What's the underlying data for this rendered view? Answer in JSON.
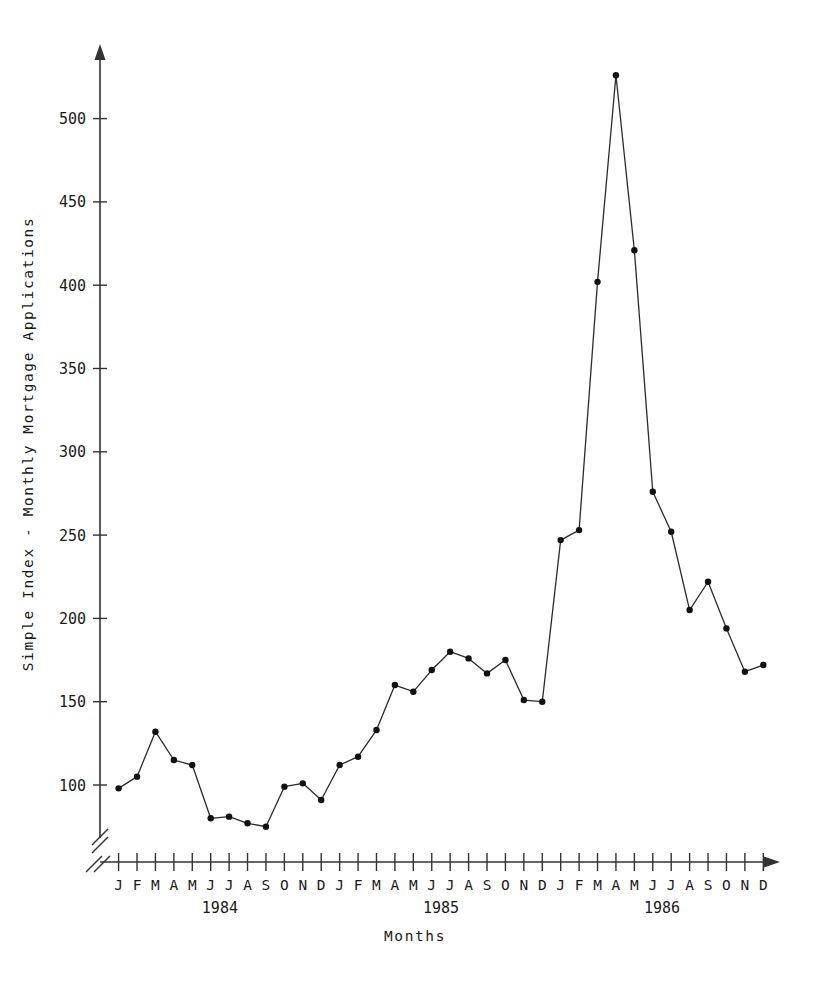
{
  "chart_data": {
    "type": "line",
    "title": "",
    "xlabel": "Months",
    "ylabel": "Simple Index - Monthly Mortgage Applications",
    "grid": false,
    "legend": "none",
    "ylim": [
      60,
      545
    ],
    "y_ticks": [
      100,
      150,
      200,
      250,
      300,
      350,
      400,
      450,
      500
    ],
    "y_axis_break": true,
    "x_axis_type": "monthly",
    "categories": [
      "J",
      "F",
      "M",
      "A",
      "M",
      "J",
      "J",
      "A",
      "S",
      "O",
      "N",
      "D",
      "J",
      "F",
      "M",
      "A",
      "M",
      "J",
      "J",
      "A",
      "S",
      "O",
      "N",
      "D",
      "J",
      "F",
      "M",
      "A",
      "M",
      "J",
      "J",
      "A",
      "S",
      "O",
      "N",
      "D"
    ],
    "year_groups": [
      {
        "label": "1984",
        "start_index": 0,
        "end_index": 11
      },
      {
        "label": "1985",
        "start_index": 12,
        "end_index": 23
      },
      {
        "label": "1986",
        "start_index": 24,
        "end_index": 35
      }
    ],
    "series": [
      {
        "name": "Simple Index",
        "values": [
          98,
          105,
          132,
          115,
          112,
          80,
          81,
          77,
          75,
          99,
          101,
          91,
          112,
          117,
          133,
          160,
          156,
          169,
          180,
          176,
          167,
          175,
          151,
          150,
          247,
          253,
          402,
          526,
          421,
          276,
          252,
          205,
          222,
          194,
          168,
          172
        ]
      }
    ],
    "point_labels": [
      "J 1984",
      "F 1984",
      "M 1984",
      "A 1984",
      "M 1984",
      "J 1984",
      "J 1984",
      "A 1984",
      "S 1984",
      "O 1984",
      "N 1984",
      "D 1984",
      "J 1985",
      "F 1985",
      "M 1985",
      "A 1985",
      "M 1985",
      "J 1985",
      "J 1985",
      "A 1985",
      "S 1985",
      "O 1985",
      "N 1985",
      "D 1985",
      "J 1986",
      "F 1986",
      "M 1986",
      "A 1986",
      "M 1986",
      "J 1986",
      "J 1986",
      "A 1986",
      "S 1986",
      "O 1986",
      "N 1986",
      "D 1986"
    ]
  },
  "figure": {
    "axis_color": "#333333",
    "line_color": "#2b2b2b",
    "marker_color": "#111111",
    "background": "#ffffff"
  }
}
